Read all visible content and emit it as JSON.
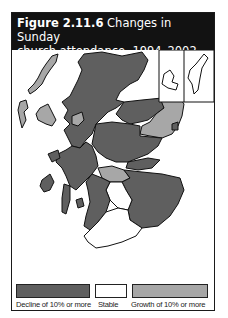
{
  "figure": {
    "number": "Figure 2.11.6",
    "title_line1": "Changes in Sunday",
    "title_line2": "church attendance, 1994–2002"
  },
  "colors": {
    "decline": "#5f5f5f",
    "stable": "#ffffff",
    "growth": "#a7a7a7",
    "border": "#111111",
    "header_bg": "#121212"
  },
  "legend": [
    {
      "key": "decline",
      "label": "Decline of 10% or more"
    },
    {
      "key": "stable",
      "label": "Stable"
    },
    {
      "key": "growth",
      "label": "Growth of 10% or more"
    }
  ],
  "map": {
    "subject": "Scotland council areas",
    "insets": [
      "Orkney",
      "Shetland"
    ],
    "regions": [
      {
        "name": "Highland",
        "category": "decline"
      },
      {
        "name": "Western Isles",
        "category": "growth"
      },
      {
        "name": "Skye / Lochalsh area",
        "category": "growth"
      },
      {
        "name": "Moray",
        "category": "decline"
      },
      {
        "name": "Aberdeenshire",
        "category": "growth"
      },
      {
        "name": "Aberdeen",
        "category": "decline"
      },
      {
        "name": "Angus",
        "category": "decline"
      },
      {
        "name": "Perth & Kinross",
        "category": "decline"
      },
      {
        "name": "Argyll & Bute",
        "category": "decline"
      },
      {
        "name": "Central belt (part)",
        "category": "growth"
      },
      {
        "name": "Lanarkshire area",
        "category": "stable"
      },
      {
        "name": "Dumfries & Galloway",
        "category": "stable"
      },
      {
        "name": "Scottish Borders",
        "category": "decline"
      },
      {
        "name": "Ayrshire",
        "category": "decline"
      },
      {
        "name": "Fife",
        "category": "decline"
      },
      {
        "name": "Orkney",
        "category": "stable"
      },
      {
        "name": "Shetland",
        "category": "stable"
      }
    ]
  }
}
